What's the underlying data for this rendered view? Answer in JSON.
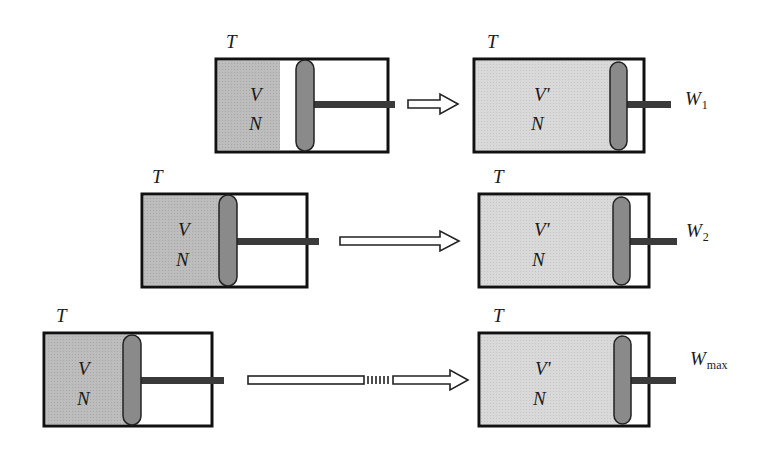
{
  "figure": {
    "colors": {
      "gas_compressed": "#b9b9b9",
      "gas_expanded": "#d6d6d6",
      "piston": "#8a8a8a",
      "rod": "#3a3a3a",
      "outline": "#111111"
    },
    "rows": [
      {
        "initial": {
          "temperature": "T",
          "volume": "V",
          "particles": "N"
        },
        "final": {
          "temperature": "T",
          "volume": "V'",
          "particles": "N"
        },
        "work": {
          "symbol": "W",
          "subscript": "1"
        },
        "arrow": "short"
      },
      {
        "initial": {
          "temperature": "T",
          "volume": "V",
          "particles": "N"
        },
        "final": {
          "temperature": "T",
          "volume": "V'",
          "particles": "N"
        },
        "work": {
          "symbol": "W",
          "subscript": "2"
        },
        "arrow": "long"
      },
      {
        "initial": {
          "temperature": "T",
          "volume": "V",
          "particles": "N"
        },
        "final": {
          "temperature": "T",
          "volume": "V'",
          "particles": "N"
        },
        "work": {
          "symbol": "W",
          "subscript": "max"
        },
        "arrow": "very long (broken)"
      }
    ]
  }
}
